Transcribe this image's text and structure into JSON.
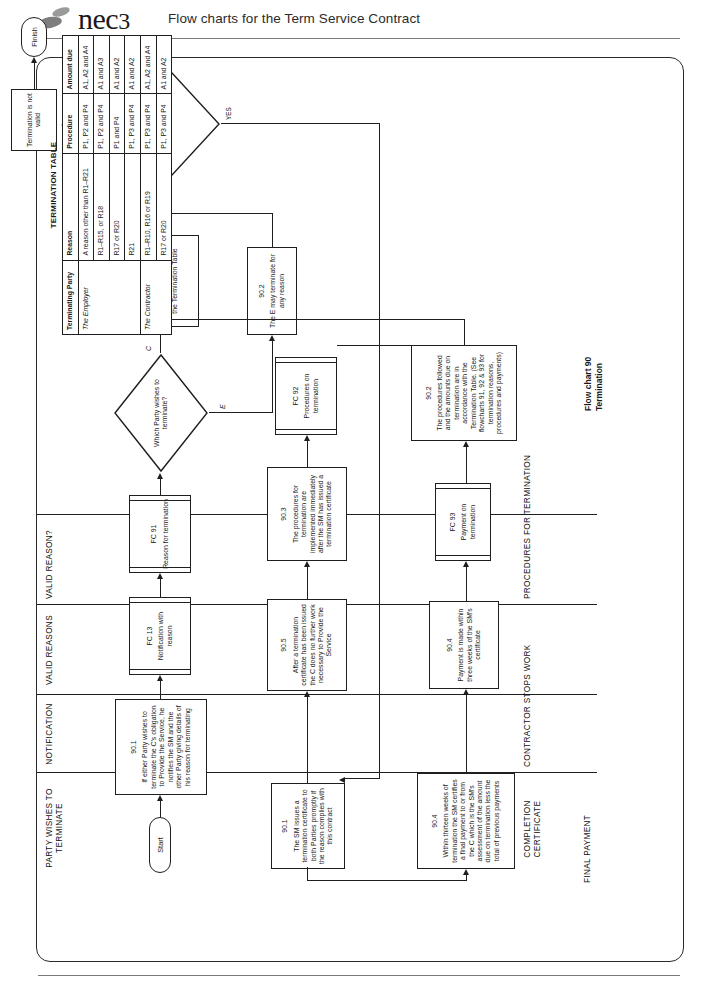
{
  "header": {
    "brand": "nec",
    "brand_number": "3",
    "title": "Flow charts for the Term Service Contract",
    "logo_icon": "nec-logo-icon"
  },
  "caption": {
    "line1": "Flow chart 90",
    "line2": "Termination"
  },
  "lanes": [
    {
      "id": "party-wishes",
      "label": "PARTY WISHES TO\nTERMINATE"
    },
    {
      "id": "notification",
      "label": "NOTIFICATION"
    },
    {
      "id": "valid-reasons",
      "label": "VALID REASONS"
    },
    {
      "id": "valid-reason-q",
      "label": "VALID REASON?"
    },
    {
      "id": "completion-certificate",
      "label": "COMPLETION\nCERTIFICATE"
    },
    {
      "id": "contractor-stops-work",
      "label": "CONTRACTOR STOPS WORK"
    },
    {
      "id": "procedures-for-termination",
      "label": "PROCEDURES FOR TERMINATION"
    },
    {
      "id": "final-payment",
      "label": "FINAL PAYMENT"
    }
  ],
  "nodes": {
    "start": {
      "label": "Start"
    },
    "finish": {
      "label": "Finish"
    },
    "n901_party": {
      "ref": "90.1",
      "body": "If either Party wishes to terminate the C's obligation to Provide the Service, he notifies the SM and the other Party giving details of his reason for terminating"
    },
    "fc13": {
      "ref": "FC 13",
      "body": "Notification with reason"
    },
    "fc91": {
      "ref": "FC 91",
      "body": "Reason for termination"
    },
    "which_party": {
      "body": "Which Party wishes to terminate?"
    },
    "n902_c": {
      "ref": "90.2",
      "body": "The C may terminate only for a reason identified in the Termination Table"
    },
    "n902_e": {
      "ref": "90.2",
      "body": "The E may terminate for any reason"
    },
    "sm_decide": {
      "body": "Does the SM decide that the reason complied with this contract?"
    },
    "not_valid": {
      "body": "Termination is not valid"
    },
    "n901_sm": {
      "ref": "90.1",
      "body": "The SM issues a termination certificate to both Parties promptly if the reason complies with this contract"
    },
    "n905": {
      "ref": "90.5",
      "body": "After a termination certificate has been issued the C does no further work necessary to Provide the Service"
    },
    "n903": {
      "ref": "90.3",
      "body": "The procedures for termination are implemented immediately after the SM has issued a termination certificate"
    },
    "fc92": {
      "ref": "FC 92",
      "body": "Procedures on termination"
    },
    "n904_within": {
      "ref": "90.4",
      "body": "Within thirteen weeks of termination the SM certifies a final payment to or from the C which is the SM's assessment of the amount due on termination less the total of previous payments"
    },
    "n904_payment": {
      "ref": "90.4",
      "body": "Payment is made within three weeks of the SM's certificate"
    },
    "fc93": {
      "ref": "FC 93",
      "body": "Payment on termination"
    },
    "n902_procedures": {
      "ref": "90.2",
      "body": "The procedures followed and the amounts due on termination are in accordance with the Termination Table. (See flowcharts 91, 92 & 93 for termination reasons, procedures and payments)"
    }
  },
  "edge_labels": {
    "no": "NO",
    "yes": "YES",
    "c": "C",
    "e": "E"
  },
  "table": {
    "title": "TERMINATION TABLE",
    "columns": [
      "Terminating Party",
      "Reason",
      "Procedure",
      "Amount due"
    ],
    "rows": [
      {
        "party": "The Employer",
        "reason": "A reason other than R1–R21",
        "procedure": "P1, P2 and P4",
        "amount": "A1, A2 and A4"
      },
      {
        "party": "",
        "reason": "R1–R15, or R18",
        "procedure": "P1, P2 and P4",
        "amount": "A1 and A3"
      },
      {
        "party": "",
        "reason": "R17 or R20",
        "procedure": "P1 and P4",
        "amount": "A1 and A2"
      },
      {
        "party": "",
        "reason": "R21",
        "procedure": "P1, P3 and P4",
        "amount": "A1 and A2"
      },
      {
        "party": "The Contractor",
        "reason": "R1–R10, R16 or R19",
        "procedure": "P1, P3 and P4",
        "amount": "A1, A2 and A4"
      },
      {
        "party": "",
        "reason": "R17 or R20",
        "procedure": "P1, P3 and P4",
        "amount": "A1 and A2"
      }
    ]
  }
}
